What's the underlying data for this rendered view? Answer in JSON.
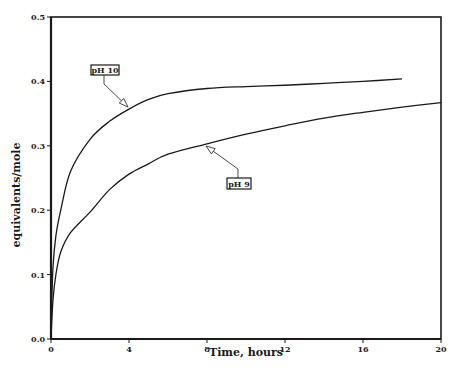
{
  "chart_data": {
    "type": "line",
    "title": "",
    "xlabel": "Time, hours",
    "ylabel": "equivalents/mole",
    "xlim": [
      0,
      20
    ],
    "ylim": [
      0.0,
      0.5
    ],
    "x_ticks": [
      0,
      4,
      8,
      12,
      16,
      20
    ],
    "x_tick_labels": [
      "0",
      "4",
      "8",
      "12",
      "16",
      "20"
    ],
    "y_ticks": [
      0.0,
      0.1,
      0.2,
      0.3,
      0.4,
      0.5
    ],
    "y_tick_labels": [
      "0.0",
      "0.1",
      "0.2",
      "0.3",
      "0.4",
      "0.5"
    ],
    "grid": false,
    "legend": "callout labels with arrows",
    "series": [
      {
        "name": "pH 10",
        "x": [
          0,
          0.1,
          0.25,
          0.5,
          1,
          2,
          3,
          4,
          5,
          6,
          8,
          10,
          12,
          14,
          16,
          18
        ],
        "values": [
          0.02,
          0.11,
          0.16,
          0.2,
          0.26,
          0.31,
          0.338,
          0.357,
          0.372,
          0.381,
          0.389,
          0.392,
          0.394,
          0.397,
          0.4,
          0.404
        ]
      },
      {
        "name": "pH 9",
        "x": [
          0,
          0.1,
          0.25,
          0.5,
          1,
          2,
          3,
          4,
          5,
          6,
          8,
          10,
          12,
          14,
          16,
          18,
          20
        ],
        "values": [
          0.0,
          0.06,
          0.1,
          0.135,
          0.165,
          0.197,
          0.232,
          0.256,
          0.272,
          0.287,
          0.303,
          0.318,
          0.331,
          0.343,
          0.352,
          0.36,
          0.367
        ]
      }
    ],
    "annotations": [
      {
        "text": "pH 10",
        "box_xy": [
          91,
          65
        ],
        "leader_to": [
          128,
          107
        ]
      },
      {
        "text": "pH 9",
        "box_xy": [
          227,
          178
        ],
        "leader_to": [
          206,
          146
        ]
      }
    ]
  },
  "colors": {
    "line": "#1a1a1a",
    "background": "#ffffff"
  }
}
